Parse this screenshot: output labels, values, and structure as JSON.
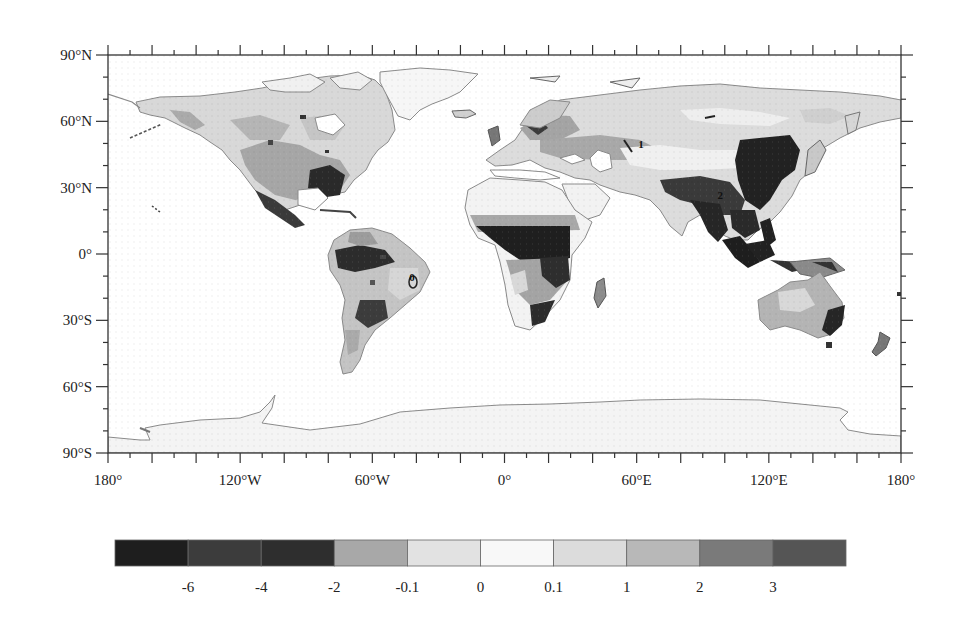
{
  "map": {
    "projection": "cylindrical-equidistant",
    "extent": {
      "lon": [
        -180,
        180
      ],
      "lat": [
        -90,
        90
      ]
    },
    "frame_px": {
      "left": 108,
      "right": 901,
      "top": 55,
      "bottom": 453
    },
    "x_ticks": [
      {
        "lon": -180,
        "label": "180°"
      },
      {
        "lon": -120,
        "label": "120°W"
      },
      {
        "lon": -60,
        "label": "60°W"
      },
      {
        "lon": 0,
        "label": "0°"
      },
      {
        "lon": 60,
        "label": "60°E"
      },
      {
        "lon": 120,
        "label": "120°E"
      },
      {
        "lon": 180,
        "label": "180°"
      }
    ],
    "y_ticks": [
      {
        "lat": 90,
        "label": "90°N"
      },
      {
        "lat": 60,
        "label": "60°N"
      },
      {
        "lat": 30,
        "label": "30°N"
      },
      {
        "lat": 0,
        "label": "0°"
      },
      {
        "lat": -30,
        "label": "30°S"
      },
      {
        "lat": -60,
        "label": "60°S"
      },
      {
        "lat": -90,
        "label": "90°S"
      }
    ],
    "contour_labels": [
      {
        "text": "1",
        "lon": 62,
        "lat": 48
      },
      {
        "text": "2",
        "lon": 98,
        "lat": 25
      },
      {
        "text": "0",
        "lon": -42,
        "lat": -12
      }
    ],
    "land_outline_color": "#8a8a8a"
  },
  "colorbar": {
    "boundaries": [
      "-6",
      "-4",
      "-2",
      "-0.1",
      "0",
      "0.1",
      "1",
      "2",
      "3"
    ],
    "colors": [
      "#1e1e1e",
      "#3c3c3c",
      "#2e2e2e",
      "#a8a8a8",
      "#e2e2e2",
      "#f8f8f8",
      "#dcdcdc",
      "#b8b8b8",
      "#7a7a7a",
      "#555555"
    ],
    "frame_px": {
      "left": 115,
      "right": 846,
      "top": 540,
      "bottom": 566
    }
  }
}
